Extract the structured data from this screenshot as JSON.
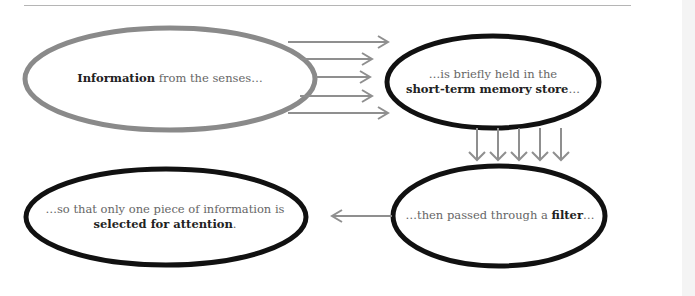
{
  "diagram": {
    "nodes": [
      {
        "id": "senses",
        "bold": "Information",
        "rest": " from the senses…",
        "outline_color": "#8a8a8a"
      },
      {
        "id": "stm",
        "line1": "…is briefly held in the",
        "bold": "short-term memory store",
        "rest": "…",
        "outline_color": "#111111"
      },
      {
        "id": "filter",
        "pre": "…then passed through a ",
        "bold": "filter",
        "rest": "…",
        "outline_color": "#111111"
      },
      {
        "id": "attention",
        "line1": "…so that only one piece of information is",
        "bold": "selected for attention",
        "rest": ".",
        "outline_color": "#111111"
      }
    ],
    "edges": [
      {
        "from": "senses",
        "to": "stm",
        "count": 5,
        "direction": "right"
      },
      {
        "from": "stm",
        "to": "filter",
        "count": 5,
        "direction": "down"
      },
      {
        "from": "filter",
        "to": "attention",
        "count": 1,
        "direction": "left"
      }
    ],
    "arrow_color": "#8f8f8f"
  }
}
